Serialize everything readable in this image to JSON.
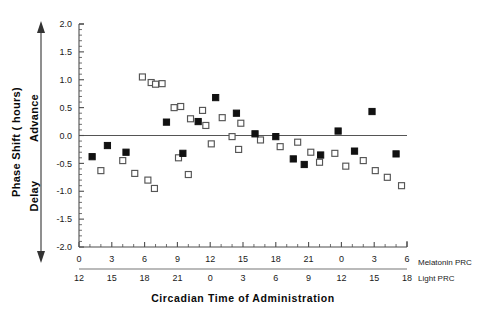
{
  "figure": {
    "axis_titles": {
      "x": "Circadian Time of Administration",
      "y_main": "Phase Shift ( hours)",
      "y_positive": "Advance",
      "y_negative": "Delay"
    },
    "row_labels": {
      "melatonin": "Melatonin PRC",
      "light": "Light PRC"
    },
    "colors": {
      "marker_filled": "#111111",
      "marker_open_stroke": "#555555",
      "axis": "#4d4d4d",
      "zero_line": "#555555",
      "background": "#ffffff"
    }
  },
  "chart_data": {
    "type": "scatter",
    "title": "",
    "xlabel": "Circadian Time of Administration",
    "ylabel": "Phase Shift ( hours)",
    "xlim": [
      0,
      30
    ],
    "ylim": [
      -2.0,
      2.0
    ],
    "grid": false,
    "legend_position": "none",
    "zero_reference_line": 0.0,
    "y_ticks": [
      2.0,
      1.5,
      1.0,
      0.5,
      0.0,
      -0.5,
      -1.0,
      -1.5,
      -2.0
    ],
    "y_tick_labels": [
      "2.0",
      "1.5",
      "1.0",
      "0.5",
      "0.0",
      "-0.5",
      "-1.0",
      "-1.5",
      "-2.0"
    ],
    "y_minor_tick_step": 0.1,
    "x_ticks": [
      0,
      3,
      6,
      9,
      12,
      15,
      18,
      21,
      24,
      27,
      30
    ],
    "x_axis_melatonin_labels": [
      "0",
      "3",
      "6",
      "9",
      "12",
      "15",
      "18",
      "21",
      "0",
      "3",
      "6"
    ],
    "x_axis_light_labels": [
      "12",
      "15",
      "18",
      "21",
      "0",
      "3",
      "6",
      "9",
      "12",
      "15",
      "18"
    ],
    "x_minor_tick_step": 1,
    "series": [
      {
        "name": "Melatonin PRC (filled squares)",
        "marker": "filled-square",
        "points": [
          {
            "x": 1.2,
            "y": -0.38
          },
          {
            "x": 2.6,
            "y": -0.18
          },
          {
            "x": 4.3,
            "y": -0.3
          },
          {
            "x": 8.0,
            "y": 0.24
          },
          {
            "x": 9.5,
            "y": -0.32
          },
          {
            "x": 10.9,
            "y": 0.25
          },
          {
            "x": 12.5,
            "y": 0.68
          },
          {
            "x": 14.4,
            "y": 0.4
          },
          {
            "x": 16.1,
            "y": 0.03
          },
          {
            "x": 18.0,
            "y": -0.02
          },
          {
            "x": 19.6,
            "y": -0.42
          },
          {
            "x": 20.6,
            "y": -0.52
          },
          {
            "x": 22.1,
            "y": -0.35
          },
          {
            "x": 23.7,
            "y": 0.08
          },
          {
            "x": 25.2,
            "y": -0.28
          },
          {
            "x": 26.8,
            "y": 0.43
          },
          {
            "x": 29.0,
            "y": -0.33
          }
        ]
      },
      {
        "name": "Light PRC (open squares)",
        "marker": "open-square",
        "points": [
          {
            "x": 2.0,
            "y": -0.63
          },
          {
            "x": 4.0,
            "y": -0.45
          },
          {
            "x": 5.1,
            "y": -0.68
          },
          {
            "x": 6.3,
            "y": -0.8
          },
          {
            "x": 5.8,
            "y": 1.05
          },
          {
            "x": 6.6,
            "y": 0.95
          },
          {
            "x": 7.0,
            "y": 0.92
          },
          {
            "x": 7.6,
            "y": 0.93
          },
          {
            "x": 6.9,
            "y": -0.95
          },
          {
            "x": 8.7,
            "y": 0.5
          },
          {
            "x": 9.3,
            "y": 0.52
          },
          {
            "x": 9.1,
            "y": -0.4
          },
          {
            "x": 10.2,
            "y": 0.3
          },
          {
            "x": 10.0,
            "y": -0.7
          },
          {
            "x": 11.3,
            "y": 0.45
          },
          {
            "x": 11.6,
            "y": 0.18
          },
          {
            "x": 12.1,
            "y": -0.15
          },
          {
            "x": 13.1,
            "y": 0.32
          },
          {
            "x": 14.0,
            "y": -0.02
          },
          {
            "x": 14.8,
            "y": 0.22
          },
          {
            "x": 14.6,
            "y": -0.25
          },
          {
            "x": 16.6,
            "y": -0.08
          },
          {
            "x": 18.4,
            "y": -0.2
          },
          {
            "x": 20.0,
            "y": -0.12
          },
          {
            "x": 21.2,
            "y": -0.3
          },
          {
            "x": 22.0,
            "y": -0.48
          },
          {
            "x": 23.4,
            "y": -0.32
          },
          {
            "x": 24.4,
            "y": -0.55
          },
          {
            "x": 26.0,
            "y": -0.45
          },
          {
            "x": 27.1,
            "y": -0.63
          },
          {
            "x": 28.2,
            "y": -0.75
          },
          {
            "x": 29.5,
            "y": -0.9
          }
        ]
      }
    ]
  }
}
